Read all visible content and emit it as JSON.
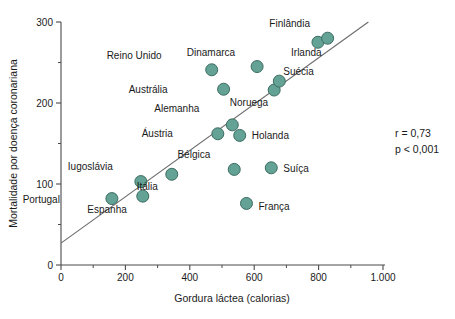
{
  "chart_data": {
    "type": "scatter",
    "title": "",
    "xlabel": "Gordura láctea (calorias)",
    "ylabel": "Mortalidade por doença coronariana",
    "xlim": [
      0,
      1000
    ],
    "ylim": [
      0,
      300
    ],
    "xticks": [
      0,
      200,
      400,
      600,
      800,
      1000
    ],
    "xticklabels": [
      "0",
      "200",
      "400",
      "600",
      "800",
      "1.000"
    ],
    "xminorticks": [
      100,
      300,
      500,
      700,
      900
    ],
    "yticks": [
      0,
      100,
      200,
      300
    ],
    "yticklabels": [
      "0",
      "100",
      "200",
      "300"
    ],
    "yminorticks": [
      50,
      150,
      250
    ],
    "grid": false,
    "legend": false,
    "marker_color": "#63a294",
    "marker_edge_color": "#3c6d62",
    "line_color": "#6b6b6b",
    "points": [
      {
        "label": "Portugal",
        "x": 158,
        "y": 82,
        "label_dx": -52,
        "label_dy": 4
      },
      {
        "label": "Iugoslávia",
        "x": 248,
        "y": 103,
        "label_dx": -28,
        "label_dy": -12
      },
      {
        "label": "Espanha",
        "x": 254,
        "y": 85,
        "label_dx": -16,
        "label_dy": 17
      },
      {
        "label": "Itália",
        "x": 344,
        "y": 112,
        "label_dx": -14,
        "label_dy": 16
      },
      {
        "label": "Reino Unido",
        "x": 468,
        "y": 241,
        "label_dx": -50,
        "label_dy": -11
      },
      {
        "label": "Austrália",
        "x": 505,
        "y": 217,
        "label_dx": -56,
        "label_dy": 4
      },
      {
        "label": "Bélgica",
        "x": 538,
        "y": 118,
        "label_dx": -24,
        "label_dy": -11
      },
      {
        "label": "Áustria",
        "x": 487,
        "y": 162,
        "label_dx": -45,
        "label_dy": 3
      },
      {
        "label": "Alemanha",
        "x": 532,
        "y": 173,
        "label_dx": -33,
        "label_dy": -13
      },
      {
        "label": "Holanda",
        "x": 555,
        "y": 160,
        "label_dx": 12,
        "label_dy": 4
      },
      {
        "label": "França",
        "x": 576,
        "y": 76,
        "label_dx": 12,
        "label_dy": 7
      },
      {
        "label": "Dinamarca",
        "x": 609,
        "y": 245,
        "label_dx": -22,
        "label_dy": -11
      },
      {
        "label": "Suíça",
        "x": 653,
        "y": 120,
        "label_dx": 12,
        "label_dy": 4
      },
      {
        "label": "Noruega",
        "x": 662,
        "y": 216,
        "label_dx": -6,
        "label_dy": 16
      },
      {
        "label": "Suécia",
        "x": 678,
        "y": 227,
        "label_dx": 4,
        "label_dy": -6
      },
      {
        "label": "Finlândia",
        "x": 798,
        "y": 275,
        "label_dx": -8,
        "label_dy": -15
      },
      {
        "label": "Irlanda",
        "x": 828,
        "y": 280,
        "label_dx": -6,
        "label_dy": 18
      }
    ],
    "regression_line": {
      "x0": 0,
      "y0": 27,
      "x1": 1000,
      "y1": 313
    },
    "annotations": [
      {
        "name": "correlation",
        "text": "r = 0,73"
      },
      {
        "name": "p-value",
        "text": "p < 0,001"
      }
    ]
  }
}
